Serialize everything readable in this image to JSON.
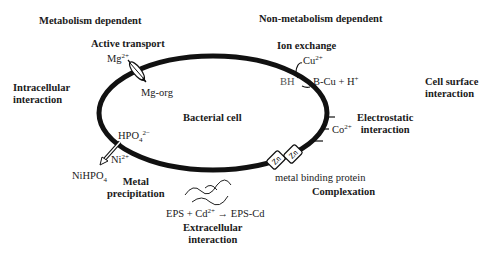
{
  "diagram": {
    "cell_label": "Bacterial cell",
    "categories": {
      "metabolism_dependent": "Metabolism dependent",
      "non_metabolism_dependent": "Non-metabolism dependent",
      "intracellular": [
        "Intracellular",
        "interaction"
      ],
      "cell_surface": [
        "Cell surface",
        "interaction"
      ],
      "extracellular": [
        "Extracellular",
        "interaction"
      ]
    },
    "mechanisms": {
      "active_transport": {
        "title": "Active transport",
        "ion": "Mg",
        "ion_charge": "2+",
        "product": "Mg-org"
      },
      "ion_exchange": {
        "title": "Ion exchange",
        "ion": "Cu",
        "ion_charge": "2+",
        "reactant": "BH",
        "product": "B-Cu + H",
        "product_charge": "+"
      },
      "electrostatic": {
        "title": [
          "Electrostatic",
          "interaction"
        ],
        "ion": "Co",
        "ion_charge": "2+"
      },
      "complexation": {
        "title": "Complexation",
        "protein": "metal binding protein",
        "metal_symbol": "Zn"
      },
      "precipitation": {
        "title": [
          "Metal",
          "precipitation"
        ],
        "anion": "HPO",
        "anion_sub": "4",
        "anion_charge": "2−",
        "ion": "Ni",
        "ion_charge": "2+",
        "product": "NiHPO",
        "product_sub": "4"
      },
      "eps": {
        "reaction_left": "EPS + Cd",
        "reaction_charge": "2+",
        "arrow": "→",
        "reaction_right": "EPS-Cd"
      }
    }
  }
}
